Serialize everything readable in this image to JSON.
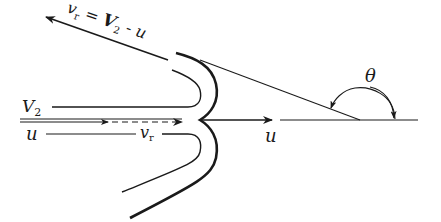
{
  "diagram": {
    "title": "",
    "labels": {
      "relative_velocity_out": {
        "v": "v",
        "v_sub": "r",
        "eq": " = ",
        "V": "V",
        "V_sub": "2",
        "minus": " - ",
        "u": "u"
      },
      "jet_velocity": {
        "V": "V",
        "V_sub": "2"
      },
      "vane_speed_left": "u",
      "relative_velocity_in": {
        "v": "v",
        "v_sub": "r"
      },
      "vane_speed_right": "u",
      "angle": "θ"
    },
    "colors": {
      "ink": "#1a1a1a",
      "background": "#ffffff"
    }
  }
}
